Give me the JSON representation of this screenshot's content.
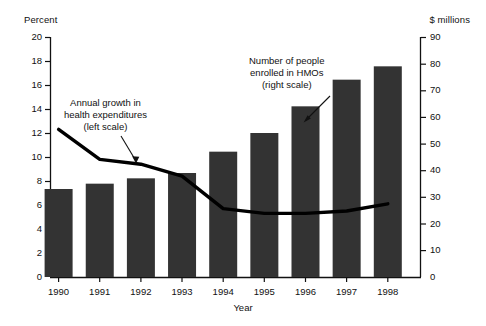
{
  "chart_data": {
    "type": "bar",
    "title": "",
    "xlabel": "Year",
    "categories": [
      "1990",
      "1991",
      "1992",
      "1993",
      "1994",
      "1995",
      "1996",
      "1997",
      "1998"
    ],
    "grid": false,
    "legend_position": "annotations",
    "series": [
      {
        "name": "Number of people enrolled in HMOs (right scale)",
        "type": "bar",
        "axis": "right",
        "unit": "$ millions",
        "values": [
          33,
          35,
          37,
          39,
          47,
          54,
          64,
          74,
          79
        ],
        "color": "#333333"
      },
      {
        "name": "Annual growth in health expenditures (left scale)",
        "type": "line",
        "axis": "left",
        "unit": "Percent",
        "values": [
          12.3,
          9.8,
          9.4,
          8.4,
          5.7,
          5.3,
          5.3,
          5.5,
          6.1
        ],
        "color": "#000000"
      }
    ],
    "left_axis": {
      "title": "Percent",
      "ylim": [
        0,
        20
      ],
      "ticks": [
        0,
        2,
        4,
        6,
        8,
        10,
        12,
        14,
        16,
        18,
        20
      ],
      "tick_labels": [
        "0",
        "2",
        "4",
        "6",
        "8",
        "10",
        "12",
        "14",
        "16",
        "18",
        "20"
      ]
    },
    "right_axis": {
      "title": "$ millions",
      "ylim": [
        0,
        90
      ],
      "ticks": [
        0,
        10,
        20,
        30,
        40,
        50,
        60,
        70,
        80,
        90
      ],
      "tick_labels": [
        "0",
        "10",
        "20",
        "30",
        "40",
        "50",
        "60",
        "70",
        "80",
        "90"
      ]
    },
    "annotations": [
      {
        "id": "line-annotation",
        "lines": [
          "Annual growth in",
          "health expenditures",
          "(left scale)"
        ],
        "points_to": "line-series"
      },
      {
        "id": "bars-annotation",
        "lines": [
          "Number of people",
          "enrolled in HMOs",
          "(right scale)"
        ],
        "points_to": "bar-series"
      }
    ]
  }
}
